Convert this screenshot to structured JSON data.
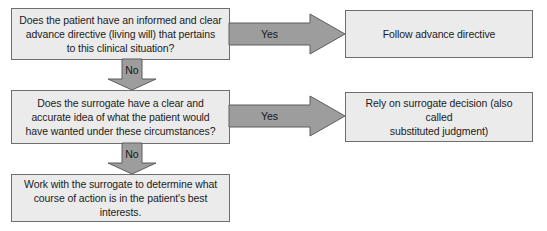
{
  "diagram": {
    "colors": {
      "box_fill": "#ebebeb",
      "box_border": "#6e6e6e",
      "arrow_fill": "#9d9d9d",
      "arrow_border": "#5d5d5d",
      "background": "#ffffff",
      "text": "#1b1b1b"
    },
    "nodes": {
      "question_1": "Does the patient have an informed and clear\nadvance directive (living will) that pertains\nto this clinical situation?",
      "question_2": "Does the surrogate have a clear and\naccurate idea of what the patient would\nhave wanted under these circumstances?",
      "outcome_1": "Follow advance directive",
      "outcome_2": "Rely on surrogate decision (also called\nsubstituted judgment)",
      "outcome_3": "Work with the surrogate to determine what\ncourse of action is in the patient's best\ninterests."
    },
    "connectors": {
      "yes_1": "Yes",
      "yes_2": "Yes",
      "no_1": "No",
      "no_2": "No"
    }
  }
}
